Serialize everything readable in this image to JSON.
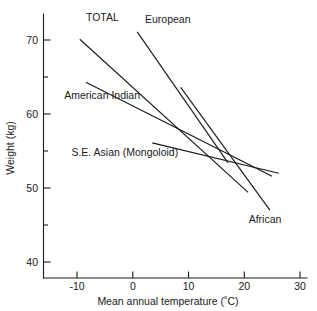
{
  "chart_data": {
    "type": "line",
    "title": "",
    "xlabel": "Mean annual temperature (˚C)",
    "ylabel": "Weight (kg)",
    "xlim": [
      -14,
      31
    ],
    "ylim": [
      37.5,
      74
    ],
    "grid": false,
    "legend_position": "inline-labels",
    "xticks": [
      -10,
      0,
      10,
      20,
      30
    ],
    "xtick_labels": [
      "-10",
      "0",
      "10",
      "20",
      "30"
    ],
    "yticks": [
      40,
      50,
      60,
      70
    ],
    "ytick_labels": [
      "40",
      "50",
      "60",
      "70"
    ],
    "yticks_minor": [
      45,
      55,
      65
    ],
    "series": [
      {
        "name": "TOTAL",
        "label": "TOTAL",
        "x": [
          -9.5,
          20.7
        ],
        "y": [
          70.1,
          49.4
        ],
        "label_x": -8.4,
        "label_y": 72.6
      },
      {
        "name": "European",
        "label": "European",
        "x": [
          0.8,
          17.1
        ],
        "y": [
          71.1,
          53.4
        ],
        "label_x": 2.2,
        "label_y": 72.3
      },
      {
        "name": "American Indian",
        "label": "American Indian",
        "x": [
          -8.4,
          25.0
        ],
        "y": [
          64.3,
          51.6
        ],
        "label_x": -12.3,
        "label_y": 62.0
      },
      {
        "name": "S.E. Asian (Mongoloid)",
        "label": "S.E. Asian (Mongoloid)",
        "x": [
          3.5,
          26.2
        ],
        "y": [
          56.1,
          52.0
        ],
        "label_x": -11.0,
        "label_y": 54.3
      },
      {
        "name": "African",
        "label": "African",
        "x": [
          8.6,
          24.6
        ],
        "y": [
          63.6,
          47.0
        ],
        "label_x": 20.8,
        "label_y": 45.3
      }
    ]
  },
  "axes": {
    "x_axis_name": "mean-annual-temperature-axis",
    "y_axis_name": "weight-axis"
  }
}
